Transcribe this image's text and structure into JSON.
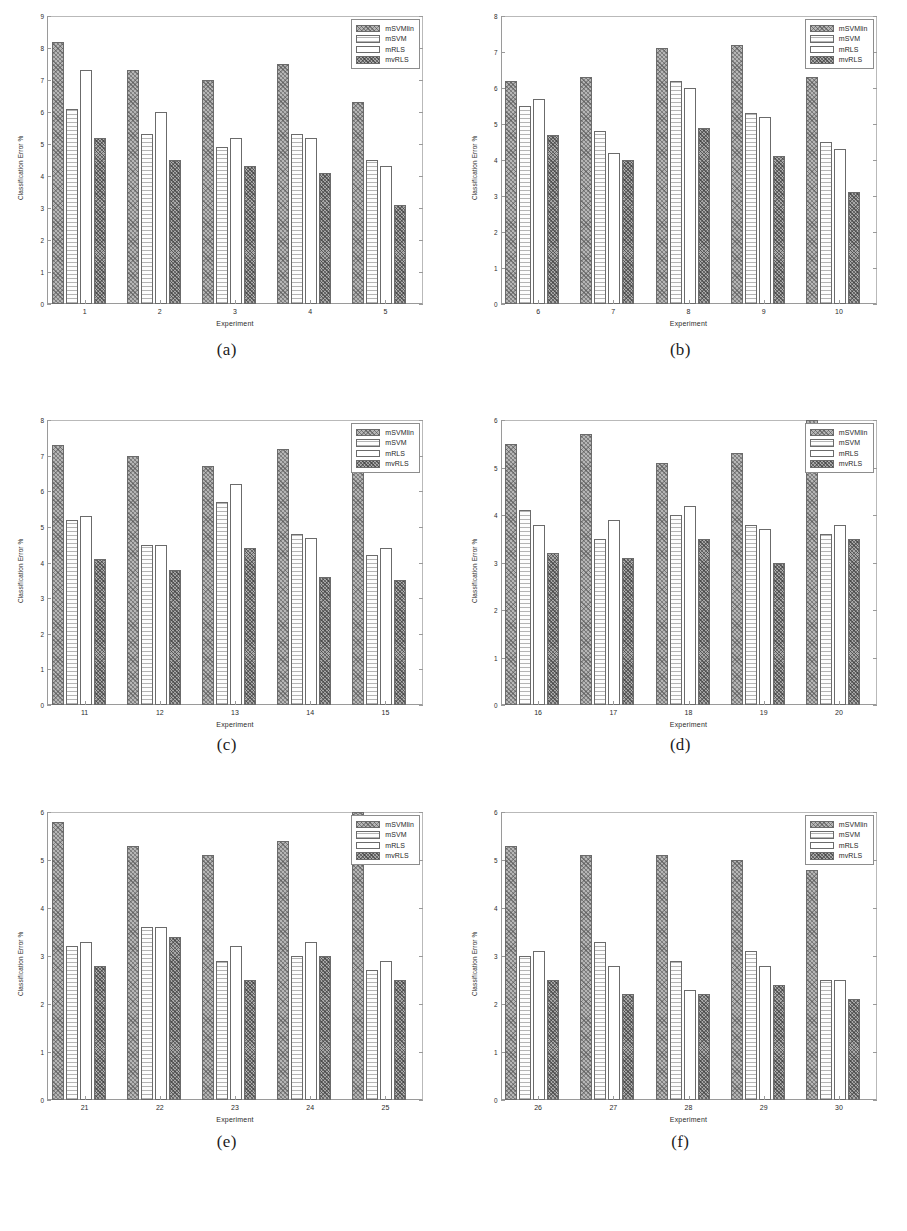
{
  "figure": {
    "series_names": [
      "mSVMlin",
      "mSVM",
      "mRLS",
      "mvRLS"
    ],
    "xlabel": "Experiment",
    "ylabel": "Classification Error %",
    "captions": [
      "(a)",
      "(b)",
      "(c)",
      "(d)",
      "(e)",
      "(f)"
    ]
  },
  "chart_data": [
    {
      "type": "bar",
      "panel": "(a)",
      "title": "",
      "xlabel": "Experiment",
      "ylabel": "Classification Error %",
      "categories": [
        "1",
        "2",
        "3",
        "4",
        "5"
      ],
      "ylim": [
        0,
        9
      ],
      "yticks": [
        0,
        1,
        2,
        3,
        4,
        5,
        6,
        7,
        8,
        9
      ],
      "grid": false,
      "legend_position": "top-right",
      "series": [
        {
          "name": "mSVMlin",
          "values": [
            8.2,
            7.3,
            7.0,
            7.5,
            6.3
          ]
        },
        {
          "name": "mSVM",
          "values": [
            6.1,
            5.3,
            4.9,
            5.3,
            4.5
          ]
        },
        {
          "name": "mRLS",
          "values": [
            7.3,
            6.0,
            5.2,
            5.2,
            4.3
          ]
        },
        {
          "name": "mvRLS",
          "values": [
            5.2,
            4.5,
            4.3,
            4.1,
            3.1
          ]
        }
      ]
    },
    {
      "type": "bar",
      "panel": "(b)",
      "title": "",
      "xlabel": "Experiment",
      "ylabel": "Classification Error %",
      "categories": [
        "6",
        "7",
        "8",
        "9",
        "10"
      ],
      "ylim": [
        0,
        8
      ],
      "yticks": [
        0,
        1,
        2,
        3,
        4,
        5,
        6,
        7,
        8
      ],
      "grid": false,
      "legend_position": "top-right",
      "series": [
        {
          "name": "mSVMlin",
          "values": [
            6.2,
            6.3,
            7.1,
            7.2,
            6.3
          ]
        },
        {
          "name": "mSVM",
          "values": [
            5.5,
            4.8,
            6.2,
            5.3,
            4.5
          ]
        },
        {
          "name": "mRLS",
          "values": [
            5.7,
            4.2,
            6.0,
            5.2,
            4.3
          ]
        },
        {
          "name": "mvRLS",
          "values": [
            4.7,
            4.0,
            4.9,
            4.1,
            3.1
          ]
        }
      ]
    },
    {
      "type": "bar",
      "panel": "(c)",
      "title": "",
      "xlabel": "Experiment",
      "ylabel": "Classification Error %",
      "categories": [
        "11",
        "12",
        "13",
        "14",
        "15"
      ],
      "ylim": [
        0,
        8
      ],
      "yticks": [
        0,
        1,
        2,
        3,
        4,
        5,
        6,
        7,
        8
      ],
      "grid": false,
      "legend_position": "top-right",
      "series": [
        {
          "name": "mSVMlin",
          "values": [
            7.3,
            7.0,
            6.7,
            7.2,
            7.9
          ]
        },
        {
          "name": "mSVM",
          "values": [
            5.2,
            4.5,
            5.7,
            4.8,
            4.2
          ]
        },
        {
          "name": "mRLS",
          "values": [
            5.3,
            4.5,
            6.2,
            4.7,
            4.4
          ]
        },
        {
          "name": "mvRLS",
          "values": [
            4.1,
            3.8,
            4.4,
            3.6,
            3.5
          ]
        }
      ]
    },
    {
      "type": "bar",
      "panel": "(d)",
      "title": "",
      "xlabel": "Experiment",
      "ylabel": "Classification Error %",
      "categories": [
        "16",
        "17",
        "18",
        "19",
        "20"
      ],
      "ylim": [
        0,
        6
      ],
      "yticks": [
        0,
        1,
        2,
        3,
        4,
        5,
        6
      ],
      "grid": false,
      "legend_position": "top-right",
      "series": [
        {
          "name": "mSVMlin",
          "values": [
            5.5,
            5.7,
            5.1,
            5.3,
            6.0
          ]
        },
        {
          "name": "mSVM",
          "values": [
            4.1,
            3.5,
            4.0,
            3.8,
            3.6
          ]
        },
        {
          "name": "mRLS",
          "values": [
            3.8,
            3.9,
            4.2,
            3.7,
            3.8
          ]
        },
        {
          "name": "mvRLS",
          "values": [
            3.2,
            3.1,
            3.5,
            3.0,
            3.5
          ]
        }
      ]
    },
    {
      "type": "bar",
      "panel": "(e)",
      "title": "",
      "xlabel": "Experiment",
      "ylabel": "Classification Error %",
      "categories": [
        "21",
        "22",
        "23",
        "24",
        "25"
      ],
      "ylim": [
        0,
        6
      ],
      "yticks": [
        0,
        1,
        2,
        3,
        4,
        5,
        6
      ],
      "grid": false,
      "legend_position": "top-right",
      "series": [
        {
          "name": "mSVMlin",
          "values": [
            5.8,
            5.3,
            5.1,
            5.4,
            6.0
          ]
        },
        {
          "name": "mSVM",
          "values": [
            3.2,
            3.6,
            2.9,
            3.0,
            2.7
          ]
        },
        {
          "name": "mRLS",
          "values": [
            3.3,
            3.6,
            3.2,
            3.3,
            2.9
          ]
        },
        {
          "name": "mvRLS",
          "values": [
            2.8,
            3.4,
            2.5,
            3.0,
            2.5
          ]
        }
      ]
    },
    {
      "type": "bar",
      "panel": "(f)",
      "title": "",
      "xlabel": "Experiment",
      "ylabel": "Classification Error %",
      "categories": [
        "26",
        "27",
        "28",
        "29",
        "30"
      ],
      "ylim": [
        0,
        6
      ],
      "yticks": [
        0,
        1,
        2,
        3,
        4,
        5,
        6
      ],
      "grid": false,
      "legend_position": "top-right",
      "series": [
        {
          "name": "mSVMlin",
          "values": [
            5.3,
            5.1,
            5.1,
            5.0,
            4.8
          ]
        },
        {
          "name": "mSVM",
          "values": [
            3.0,
            3.3,
            2.9,
            3.1,
            2.5
          ]
        },
        {
          "name": "mRLS",
          "values": [
            3.1,
            2.8,
            2.3,
            2.8,
            2.5
          ]
        },
        {
          "name": "mvRLS",
          "values": [
            2.5,
            2.2,
            2.2,
            2.4,
            2.1
          ]
        }
      ]
    }
  ]
}
